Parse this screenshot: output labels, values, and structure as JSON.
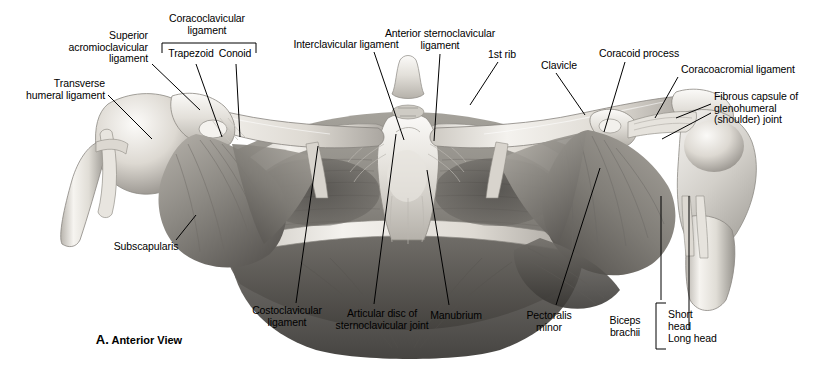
{
  "figure": {
    "caption_letter": "A.",
    "caption_text": "Anterior View",
    "view": "Anterior View",
    "style": "grayscale anatomical illustration"
  },
  "labels": [
    {
      "id": "superior-acromioclavicular-ligament",
      "lines": [
        "Superior",
        "acromioclavicular",
        "ligament"
      ],
      "x": 148,
      "y": 30,
      "align": "right"
    },
    {
      "id": "transverse-humeral-ligament",
      "lines": [
        "Transverse",
        "humeral ligament"
      ],
      "x": 105,
      "y": 78,
      "align": "right"
    },
    {
      "id": "coracoclavicular-ligament",
      "lines": [
        "Coracoclavicular",
        "ligament"
      ],
      "x": 207,
      "y": 13,
      "align": "center"
    },
    {
      "id": "trapezoid",
      "lines": [
        "Trapezoid"
      ],
      "x": 189,
      "y": 50,
      "align": "center"
    },
    {
      "id": "conoid",
      "lines": [
        "Conoid"
      ],
      "x": 235,
      "y": 50,
      "align": "center"
    },
    {
      "id": "interclavicular-ligament",
      "lines": [
        "Interclavicular ligament"
      ],
      "x": 346,
      "y": 41,
      "align": "center"
    },
    {
      "id": "anterior-sternoclavicular-ligament",
      "lines": [
        "Anterior sternoclavicular",
        "ligament"
      ],
      "x": 440,
      "y": 29,
      "align": "center"
    },
    {
      "id": "first-rib",
      "lines": [
        "1st rib"
      ],
      "x": 502,
      "y": 51,
      "align": "center"
    },
    {
      "id": "clavicle",
      "lines": [
        "Clavicle"
      ],
      "x": 559,
      "y": 62,
      "align": "center"
    },
    {
      "id": "coracoid-process",
      "lines": [
        "Coracoid process"
      ],
      "x": 639,
      "y": 50,
      "align": "center"
    },
    {
      "id": "coracoacromial-ligament",
      "lines": [
        "Coracoacromial ligament"
      ],
      "x": 738,
      "y": 66,
      "align": "center"
    },
    {
      "id": "fibrous-capsule-glenohumeral-joint",
      "lines": [
        "Fibrous capsule of",
        "glenohumeral",
        "(shoulder) joint",
        ""
      ],
      "x": 714,
      "y": 93,
      "align": "left"
    },
    {
      "id": "subscapularis",
      "lines": [
        "Subscapularis"
      ],
      "x": 146,
      "y": 243,
      "align": "center"
    },
    {
      "id": "costoclavicular-ligament",
      "lines": [
        "Costoclavicular",
        "ligament"
      ],
      "x": 287,
      "y": 307,
      "align": "center"
    },
    {
      "id": "articular-disc-of-sternoclavicular-joint",
      "lines": [
        "Articular disc of",
        "sternoclavicular joint"
      ],
      "x": 382,
      "y": 310,
      "align": "center"
    },
    {
      "id": "manubrium",
      "lines": [
        "Manubrium"
      ],
      "x": 456,
      "y": 312,
      "align": "center"
    },
    {
      "id": "pectoralis-minor",
      "lines": [
        "Pectoralis",
        "minor"
      ],
      "x": 549,
      "y": 312,
      "align": "center"
    },
    {
      "id": "biceps-brachii",
      "lines": [
        "Biceps",
        "brachii"
      ],
      "x": 625,
      "y": 317,
      "align": "center"
    },
    {
      "id": "short-head",
      "lines": [
        "Short",
        "head"
      ],
      "x": 666,
      "y": 311,
      "align": "left"
    },
    {
      "id": "long-head",
      "lines": [
        "Long head"
      ],
      "x": 666,
      "y": 335,
      "align": "left"
    }
  ],
  "brackets": {
    "coracoclavicular": {
      "label": "Coracoclavicular ligament",
      "members": [
        "Trapezoid",
        "Conoid"
      ]
    },
    "biceps_brachii": {
      "label": "Biceps brachii",
      "members": [
        "Short head",
        "Long head"
      ]
    }
  },
  "colors": {
    "background": "#ffffff",
    "text": "#000000",
    "leader_line": "#000000",
    "bone_light": "#f0efec",
    "bone_mid": "#cfccc6",
    "muscle_mid": "#9d9a95",
    "muscle_dark": "#6a6763",
    "shadow": "#3b3936"
  }
}
